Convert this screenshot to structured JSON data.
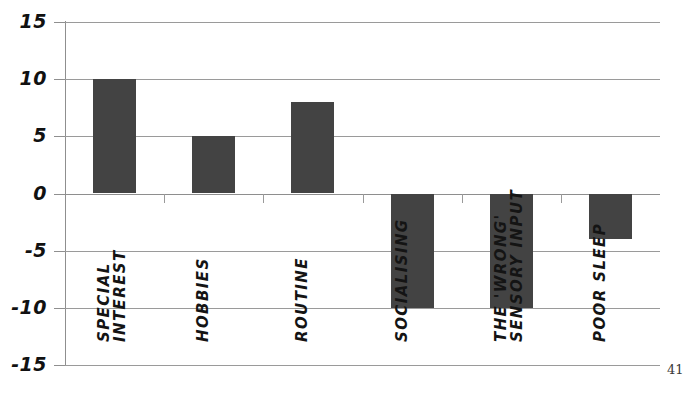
{
  "page": {
    "page_number": "41"
  },
  "chart_data": {
    "type": "bar",
    "title": "",
    "subtitle": "",
    "xlabel": "",
    "ylabel": "",
    "ylim": [
      -15,
      15
    ],
    "grid": true,
    "legend": null,
    "orientation": "vertical",
    "bar_color": "#434343",
    "gridline_color": "#9a9a9a",
    "categories": [
      "SPECIAL INTEREST",
      "HOBBIES",
      "ROUTINE",
      "SOCIALISING",
      "THE 'WRONG' SENSORY INPUT",
      "POOR SLEEP"
    ],
    "category_label_lines": [
      [
        "SPECIAL",
        "INTEREST"
      ],
      [
        "HOBBIES"
      ],
      [
        "ROUTINE"
      ],
      [
        "SOCIALISING"
      ],
      [
        "THE 'WRONG'",
        "SENSORY INPUT"
      ],
      [
        "POOR SLEEP"
      ]
    ],
    "values": [
      10,
      5,
      8,
      -10,
      -10,
      -4
    ],
    "ytick_labels": [
      "15",
      "10",
      "5",
      "0",
      "-5",
      "-10",
      "-15"
    ],
    "ytick_values": [
      15,
      10,
      5,
      0,
      -5,
      -10,
      -15
    ]
  }
}
